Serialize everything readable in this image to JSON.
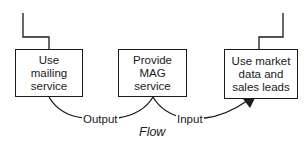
{
  "diagram": {
    "boxes": [
      {
        "id": "mailing",
        "label": "Use mailing service"
      },
      {
        "id": "mag",
        "label": "Provide MAG service"
      },
      {
        "id": "market",
        "label": "Use market data and sales leads"
      }
    ],
    "flows": [
      {
        "from": "mag",
        "to": "mailing",
        "label": "Output"
      },
      {
        "from": "mag",
        "to": "market",
        "label": "Input"
      }
    ],
    "caption": "Flow",
    "colors": {
      "stroke": "#1a1a1a",
      "background": "#ffffff"
    }
  }
}
